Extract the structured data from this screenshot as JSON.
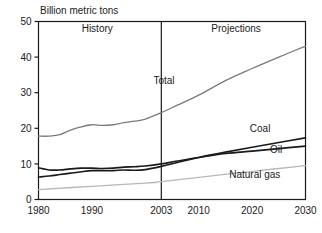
{
  "chart_data": {
    "type": "line",
    "title": "Billion metric tons",
    "xlabel": "",
    "ylabel": "",
    "xlim": [
      1980,
      2030
    ],
    "ylim": [
      0,
      50
    ],
    "yticks": [
      0,
      10,
      20,
      30,
      40,
      50
    ],
    "ytick_labels": [
      "0",
      "10",
      "20",
      "30",
      "40",
      "50"
    ],
    "xticks": [
      1980,
      1990,
      2003,
      2010,
      2020,
      2030
    ],
    "xtick_labels": [
      "1980",
      "1990",
      "2003",
      "2010",
      "2020",
      "2030"
    ],
    "grid": false,
    "legend": "inline-annotations",
    "annotations": [
      {
        "text": "History",
        "x": 1991,
        "y": 47
      },
      {
        "text": "Projections",
        "x": 2017,
        "y": 47
      },
      {
        "text": "Total",
        "x": 2003.5,
        "y": 32.5
      },
      {
        "text": "Coal",
        "x": 2021.5,
        "y": 19.0
      },
      {
        "text": "Oil",
        "x": 2024.5,
        "y": 13.0
      },
      {
        "text": "Natural gas",
        "x": 2020.5,
        "y": 6.0
      }
    ],
    "divider_x": 2003,
    "divider_label": "history-projection-divider",
    "series": [
      {
        "name": "Total",
        "color": "#7a7a7a",
        "width": 1.3,
        "x": [
          1980,
          1982,
          1984,
          1986,
          1988,
          1990,
          1992,
          1994,
          1996,
          1998,
          2000,
          2003,
          2006,
          2010,
          2015,
          2020,
          2025,
          2030
        ],
        "values": [
          17.8,
          17.8,
          18.2,
          19.5,
          20.4,
          21.0,
          20.8,
          21.0,
          21.6,
          22.0,
          22.6,
          24.4,
          26.5,
          29.3,
          33.4,
          36.8,
          40.0,
          43.1
        ]
      },
      {
        "name": "Coal",
        "color": "#1a1a1a",
        "width": 1.6,
        "x": [
          1980,
          1982,
          1984,
          1986,
          1988,
          1990,
          1992,
          1994,
          1996,
          1998,
          2000,
          2003,
          2006,
          2010,
          2015,
          2020,
          2025,
          2030
        ],
        "values": [
          6.3,
          6.6,
          7.0,
          7.4,
          7.8,
          8.1,
          8.1,
          8.1,
          8.3,
          8.2,
          8.4,
          9.3,
          10.4,
          11.8,
          13.3,
          14.7,
          16.0,
          17.3
        ]
      },
      {
        "name": "Oil",
        "color": "#1a1a1a",
        "width": 1.6,
        "x": [
          1980,
          1982,
          1984,
          1986,
          1988,
          1990,
          1992,
          1994,
          1996,
          1998,
          2000,
          2003,
          2006,
          2010,
          2015,
          2020,
          2025,
          2030
        ],
        "values": [
          8.9,
          8.3,
          8.3,
          8.6,
          8.8,
          8.8,
          8.7,
          8.8,
          9.1,
          9.2,
          9.4,
          10.0,
          10.8,
          11.8,
          12.9,
          13.6,
          14.3,
          15.0
        ]
      },
      {
        "name": "Natural gas",
        "color": "#b8b8b8",
        "width": 1.3,
        "x": [
          1980,
          1990,
          2000,
          2003,
          2010,
          2020,
          2030
        ],
        "values": [
          2.8,
          3.7,
          4.6,
          5.0,
          6.2,
          7.9,
          9.5
        ]
      }
    ]
  }
}
